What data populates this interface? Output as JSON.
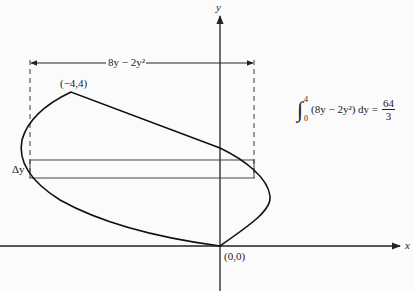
{
  "figure": {
    "axes": {
      "x_label": "x",
      "y_label": "y"
    },
    "points": [
      {
        "label": "(−4,4)",
        "x": -4,
        "y": 4
      },
      {
        "label": "(0,0)",
        "x": 0,
        "y": 0
      }
    ],
    "width_label": "8y − 2y²",
    "strip_label": "Δy",
    "integral": {
      "lower": "0",
      "upper": "4",
      "integrand": "(8y − 2y²) dy =",
      "result_num": "64",
      "result_den": "3"
    }
  }
}
